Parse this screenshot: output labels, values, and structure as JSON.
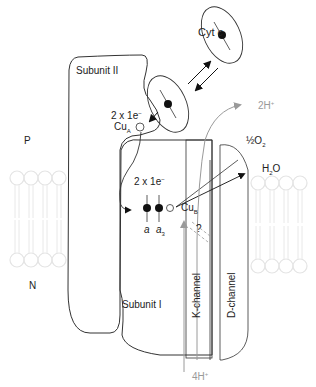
{
  "diagram": {
    "labels": {
      "cyt_c": "Cyt",
      "cyt_c_italic": "c",
      "subunit_ii": "Subunit II",
      "subunit_i": "Subunit I",
      "electrons_top": "2 x 1e",
      "electrons_top_sup": "−",
      "cu_a": "Cu",
      "cu_a_sub": "A",
      "electrons_mid": "2 x 1e",
      "electrons_mid_sup": "−",
      "heme_a": "a",
      "heme_a3": "a",
      "heme_a3_sub": "3",
      "cu_b": "Cu",
      "cu_b_sub": "B",
      "p_side": "P",
      "n_side": "N",
      "half_o2_frac": "½",
      "half_o2": "O",
      "half_o2_sub": "2",
      "water": "H",
      "water_sub": "2",
      "water_o": "O",
      "pumped_protons": "2H",
      "pumped_protons_sup": "+",
      "substrate_protons": "4H",
      "substrate_protons_sup": "+",
      "k_channel": "K-channel",
      "d_channel": "D-channel",
      "unknown_path": "?"
    },
    "colors": {
      "line": "#333333",
      "proton": "#9a9a9a",
      "membrane": "#e6e6e6"
    }
  }
}
